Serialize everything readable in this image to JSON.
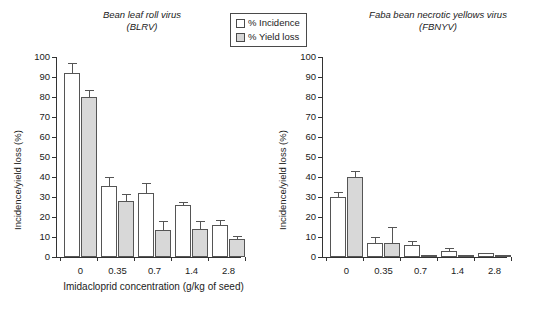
{
  "figure": {
    "xaxis_title": "Imidacloprid concentration (g/kg of seed)",
    "yaxis_title": "Incidence/yield loss (%)"
  },
  "legend": {
    "items": [
      {
        "label": "% Incidence",
        "swatch": "white-square-icon",
        "color": "#ffffff"
      },
      {
        "label": "% Yield loss",
        "swatch": "gray-square-icon",
        "color": "#d8d8d8"
      }
    ]
  },
  "panels": [
    {
      "key": "blrv",
      "title_line1": "Bean leaf roll virus",
      "title_line2": "(BLRV)"
    },
    {
      "key": "fbnyv",
      "title_line1": "Faba bean necrotic yellows virus",
      "title_line2": "(FBNYV)"
    }
  ],
  "axis": {
    "y_ticks": [
      "0",
      "10",
      "20",
      "30",
      "40",
      "50",
      "60",
      "70",
      "80",
      "90",
      "100"
    ],
    "x_ticks": [
      "0",
      "0.35",
      "0.7",
      "1.4",
      "2.8"
    ]
  },
  "chart_data": [
    {
      "type": "bar",
      "title": "Bean leaf roll virus (BLRV)",
      "xlabel": "Imidacloprid concentration (g/kg of seed)",
      "ylabel": "Incidence/yield loss (%)",
      "categories": [
        "0",
        "0.35",
        "0.7",
        "1.4",
        "2.8"
      ],
      "ylim": [
        0,
        100
      ],
      "ytick_step": 10,
      "grid": false,
      "legend_position": "top-center",
      "error_bars": "upper-only (SE)",
      "series": [
        {
          "name": "% Incidence",
          "color": "#ffffff",
          "values": [
            92,
            35.5,
            32,
            26,
            16
          ],
          "errors": [
            5,
            4.5,
            5,
            1.5,
            2.5
          ]
        },
        {
          "name": "% Yield loss",
          "color": "#d8d8d8",
          "values": [
            80,
            28,
            13.5,
            14,
            9
          ],
          "errors": [
            3.5,
            3.5,
            4.5,
            4,
            1.5
          ]
        }
      ]
    },
    {
      "type": "bar",
      "title": "Faba bean necrotic yellows virus (FBNYV)",
      "xlabel": "Imidacloprid concentration (g/kg of seed)",
      "ylabel": "Incidence/yield loss (%)",
      "categories": [
        "0",
        "0.35",
        "0.7",
        "1.4",
        "2.8"
      ],
      "ylim": [
        0,
        100
      ],
      "ytick_step": 10,
      "grid": false,
      "legend_position": "top-center",
      "error_bars": "upper-only (SE)",
      "series": [
        {
          "name": "% Incidence",
          "color": "#ffffff",
          "values": [
            30,
            7,
            6,
            3,
            2
          ],
          "errors": [
            2.5,
            3,
            2,
            1.5,
            0
          ]
        },
        {
          "name": "% Yield loss",
          "color": "#d8d8d8",
          "values": [
            40,
            7,
            0.4,
            0,
            0
          ],
          "errors": [
            3,
            8,
            0,
            0,
            0
          ]
        }
      ]
    }
  ]
}
